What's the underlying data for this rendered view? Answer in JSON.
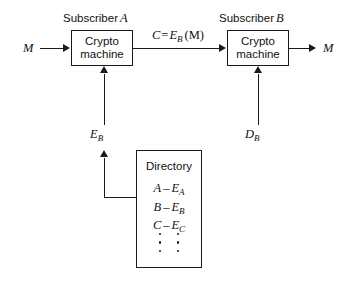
{
  "diagram": {
    "nodes": {
      "subscriber_a_label_text": "Subscriber",
      "subscriber_a_label_id": "A",
      "subscriber_b_label_text": "Subscriber",
      "subscriber_b_label_id": "B",
      "crypto_machine_a_line1": "Crypto",
      "crypto_machine_a_line2": "machine",
      "crypto_machine_b_line1": "Crypto",
      "crypto_machine_b_line2": "machine",
      "directory_title": "Directory"
    },
    "signals": {
      "plaintext_in": "M",
      "plaintext_out": "M",
      "ciphertext_c": "C",
      "ciphertext_eq": "=",
      "ciphertext_e": "E",
      "ciphertext_e_sub": "B",
      "ciphertext_arg": "(M)",
      "encrypt_key_e": "E",
      "encrypt_key_sub": "B",
      "decrypt_key_d": "D",
      "decrypt_key_sub": "B"
    },
    "directory_entries": [
      {
        "subscriber": "A",
        "dash": "–",
        "key": "E",
        "key_sub": "A"
      },
      {
        "subscriber": "B",
        "dash": "–",
        "key": "E",
        "key_sub": "B"
      },
      {
        "subscriber": "C",
        "dash": "–",
        "key": "E",
        "key_sub": "C"
      }
    ],
    "ellipsis_columns": 2,
    "ellipsis_dots_per_column": 3,
    "colors": {
      "stroke": "#1a1a1a",
      "text": "#111111",
      "background": "#ffffff"
    }
  }
}
